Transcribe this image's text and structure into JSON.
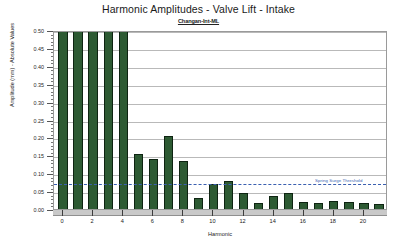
{
  "chart_data": {
    "type": "bar",
    "title": "Harmonic Amplitudes - Valve Lift - Intake",
    "subtitle": "Changan-Int-ML",
    "xlabel": "Harmonic",
    "ylabel": "Amplitude (mm) - Absolute Values",
    "ylim": [
      0.0,
      0.5
    ],
    "xlim": [
      -0.6,
      21.6
    ],
    "grid": "horizontal",
    "legend": "none",
    "bar_color": "#2d5a33",
    "bar_edge_color": "#0e2412",
    "y_ticks": [
      0.0,
      0.05,
      0.1,
      0.15,
      0.2,
      0.25,
      0.3,
      0.35,
      0.4,
      0.45,
      0.5
    ],
    "y_tick_labels": [
      "0.00",
      "0.05",
      "0.10",
      "0.15",
      "0.20",
      "0.25",
      "0.30",
      "0.35",
      "0.40",
      "0.45",
      "0.50"
    ],
    "x_ticks": [
      0,
      2,
      4,
      6,
      8,
      10,
      12,
      14,
      16,
      18,
      20
    ],
    "x_tick_labels": [
      "0",
      "2",
      "4",
      "6",
      "8",
      "10",
      "12",
      "14",
      "16",
      "18",
      "20"
    ],
    "categories": [
      0,
      1,
      2,
      3,
      4,
      5,
      6,
      7,
      8,
      9,
      10,
      11,
      12,
      13,
      14,
      15,
      16,
      17,
      18,
      19,
      20,
      21
    ],
    "values": [
      0.5,
      0.5,
      0.5,
      0.5,
      0.5,
      0.148,
      0.135,
      0.197,
      0.128,
      0.025,
      0.065,
      0.073,
      0.04,
      0.012,
      0.032,
      0.04,
      0.013,
      0.011,
      0.018,
      0.014,
      0.012,
      0.008
    ],
    "clipped_bars": [
      0,
      1,
      2,
      3,
      4
    ],
    "annotations": [
      {
        "name": "spring-surge-threshold",
        "label": "Spring Surge Threshold",
        "value": 0.075,
        "style": "dashed",
        "color": "#3a5fb0"
      }
    ]
  }
}
